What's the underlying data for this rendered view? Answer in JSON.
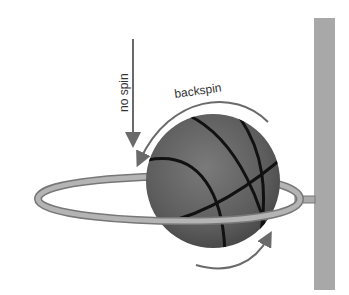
{
  "diagram": {
    "labels": {
      "no_spin": "no spin",
      "backspin": "backspin"
    },
    "elements": [
      "basketball",
      "hoop-rim",
      "backboard",
      "no-spin-arrow",
      "backspin-arrow-top",
      "backspin-arrow-bottom"
    ],
    "colors": {
      "ball": "#5a5a5a",
      "seams": "#111111",
      "rim": "#9a9a9a",
      "backboard": "#a8a8a8",
      "arrows": "#6a6a6a"
    }
  }
}
